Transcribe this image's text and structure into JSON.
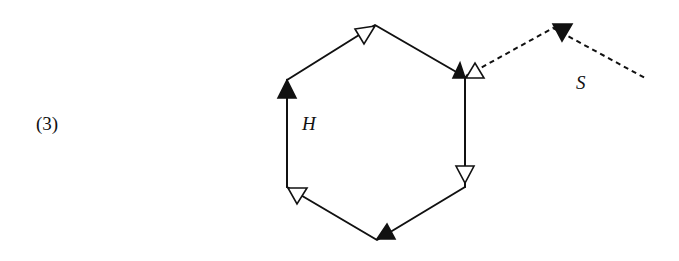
{
  "figure": {
    "number_label": "(3)",
    "loop_label": "H",
    "string_label": "S",
    "colors": {
      "stroke": "#111111",
      "filled_arrow": "#111111",
      "hollow_arrow": "#ffffff",
      "background": "#ffffff"
    },
    "hexagon": {
      "vertices": [
        [
          375,
          25
        ],
        [
          465,
          77
        ],
        [
          465,
          187
        ],
        [
          377,
          240
        ],
        [
          287,
          187
        ],
        [
          287,
          80
        ]
      ],
      "line_style": "solid"
    },
    "dashed_path": {
      "points": [
        [
          465,
          77
        ],
        [
          553,
          28
        ],
        [
          645,
          78
        ]
      ],
      "line_style": "dashed"
    },
    "arrows": [
      {
        "name": "top",
        "fill": "hollow",
        "direction": "down"
      },
      {
        "name": "upper-right-left",
        "fill": "filled",
        "direction": "up"
      },
      {
        "name": "upper-right-right",
        "fill": "hollow",
        "direction": "up"
      },
      {
        "name": "upper-left",
        "fill": "filled",
        "direction": "up"
      },
      {
        "name": "lower-right",
        "fill": "hollow",
        "direction": "down"
      },
      {
        "name": "bottom",
        "fill": "filled",
        "direction": "up"
      },
      {
        "name": "lower-left",
        "fill": "hollow",
        "direction": "down"
      },
      {
        "name": "dashed-peak",
        "fill": "filled",
        "direction": "down"
      }
    ]
  }
}
